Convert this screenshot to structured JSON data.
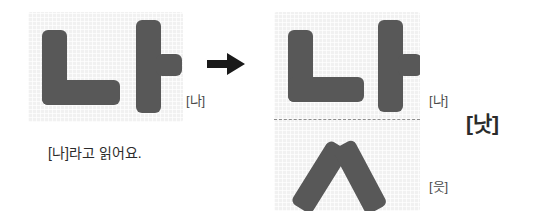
{
  "diagram": {
    "type": "hangul-syllable-composition",
    "source_syllable": "나",
    "added_jamo": "ㅅ",
    "result_syllable": "낫"
  },
  "left": {
    "panel_label": "[나]",
    "caption": "[나]라고 읽어요.",
    "strokes": {
      "n_jamo": "ㄴ",
      "a_jamo": "ㅏ"
    }
  },
  "arrow": {
    "icon": "arrow-right-icon",
    "direction": "right"
  },
  "right": {
    "top_label": "[나]",
    "bottom_label": "[읏]",
    "result_label": "[낫]",
    "strokes": {
      "n_jamo": "ㄴ",
      "a_jamo": "ㅏ",
      "s_jamo": "ㅅ"
    }
  },
  "colors": {
    "stroke": "#585858",
    "panel_background": "#f1f1f1",
    "page_background": "#ffffff",
    "label_text": "#4a4a4a",
    "caption_text": "#2b2b2b",
    "divider": "#8d8d8d",
    "arrow": "#1a1a1a"
  }
}
